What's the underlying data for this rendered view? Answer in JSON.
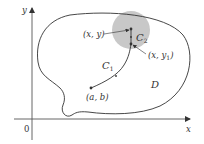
{
  "diagram": {
    "axes": {
      "x_label": "x",
      "y_label": "y",
      "origin_label": "0"
    },
    "region": {
      "label": "D"
    },
    "points": {
      "start": "(a, b)",
      "target": "(x, y)",
      "intermediate_prefix": "(x, y",
      "intermediate_sub": "1",
      "intermediate_suffix": ")"
    },
    "curves": {
      "c1_letter": "C",
      "c1_sub": "1",
      "c2_letter": "C",
      "c2_sub": "2"
    },
    "colors": {
      "disk_fill": "#c8c8c8",
      "stroke": "#333333",
      "background": "#ffffff"
    }
  }
}
